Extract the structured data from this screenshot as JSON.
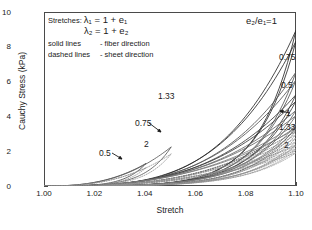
{
  "chart_data": {
    "type": "line",
    "title": "",
    "xlabel": "Stretch",
    "ylabel": "Cauchy Stress (kPa)",
    "xlim": [
      1.0,
      1.1
    ],
    "ylim": [
      0,
      10
    ],
    "xticks": [
      "1.00",
      "1.02",
      "1.04",
      "1.06",
      "1.08",
      "1.10"
    ],
    "yticks": [
      "0",
      "2",
      "4",
      "6",
      "8",
      "10"
    ],
    "grid": false,
    "legend_position": "inline-annotations",
    "notes": {
      "stretches_label": "Stretches:",
      "eq1": "λ₁ = 1 + e₁",
      "eq2": "λ₂ = 1 + e₂",
      "solid_key": "solid lines",
      "solid_desc": "- fiber direction",
      "dashed_key": "dashed lines",
      "dashed_desc": "- sheet direction"
    },
    "annotations": [
      {
        "name": "ratio-top",
        "text": "e₂/e₁=1",
        "x": 246,
        "y": 16
      },
      {
        "name": "ratio-075-right",
        "text": "0.75",
        "x": 279,
        "y": 53
      },
      {
        "name": "ratio-05-right",
        "text": "0.5",
        "x": 281,
        "y": 81
      },
      {
        "name": "ratio-1-right",
        "text": "1",
        "x": 286,
        "y": 109
      },
      {
        "name": "ratio-133-right",
        "text": "1.33",
        "x": 279,
        "y": 123
      },
      {
        "name": "ratio-2-right",
        "text": "2",
        "x": 284,
        "y": 141
      },
      {
        "name": "ratio-133-mid",
        "text": "1.33",
        "x": 158,
        "y": 92
      },
      {
        "name": "ratio-075-mid",
        "text": "0.75",
        "x": 135,
        "y": 119
      },
      {
        "name": "ratio-2-mid",
        "text": "2",
        "x": 144,
        "y": 140
      },
      {
        "name": "ratio-05-mid",
        "text": "0.5",
        "x": 99,
        "y": 149
      }
    ],
    "series": [
      {
        "name": "fiber e2/e1=1",
        "direction": "fiber",
        "ratio": "1",
        "style": "solid",
        "color": "#2b2b2b",
        "peak": 8.95,
        "loop": true
      },
      {
        "name": "fiber e2/e1=0.75",
        "direction": "fiber",
        "ratio": "0.75",
        "style": "solid",
        "color": "#555555",
        "peak": 6.55,
        "loop": true
      },
      {
        "name": "fiber e2/e1=0.5",
        "direction": "fiber",
        "ratio": "0.5",
        "style": "solid",
        "color": "#3a3a3a",
        "peak": 5.25,
        "loop": true
      },
      {
        "name": "fiber e2/e1=1.33",
        "direction": "fiber",
        "ratio": "1.33",
        "style": "solid",
        "color": "#666666",
        "peak": 4.35,
        "loop": true
      },
      {
        "name": "fiber e2/e1=2",
        "direction": "fiber",
        "ratio": "2",
        "style": "solid",
        "color": "#7a7a7a",
        "peak": 3.55,
        "loop": true
      },
      {
        "name": "sheet e2/e1=1",
        "direction": "sheet",
        "ratio": "1",
        "style": "dashed",
        "color": "#555555",
        "peak": 3.4,
        "loop": true
      },
      {
        "name": "sheet e2/e1=1.33",
        "direction": "sheet",
        "ratio": "1.33",
        "style": "dashed",
        "color": "#8a8a8a",
        "peak": 2.95,
        "loop": true
      },
      {
        "name": "sheet e2/e1=2",
        "direction": "sheet",
        "ratio": "2",
        "style": "dashed",
        "color": "#9a9a9a",
        "peak": 2.3,
        "loop": true
      },
      {
        "name": "sheet e2/e1=0.75",
        "direction": "sheet",
        "ratio": "0.75",
        "style": "dashed",
        "color": "#888888",
        "peak": 2.55,
        "loop": true
      },
      {
        "name": "sheet e2/e1=0.5",
        "direction": "sheet",
        "ratio": "0.5",
        "style": "dashed",
        "color": "#909090",
        "peak": 2.05,
        "loop": true
      }
    ],
    "short_curves": [
      {
        "name": "short-0.5-fiber",
        "end_x": 1.0405,
        "peak": 1.3,
        "style": "solid",
        "color": "#4a4a4a"
      },
      {
        "name": "short-2-fiber",
        "end_x": 1.0505,
        "peak": 2.25,
        "style": "solid",
        "color": "#5a5a5a"
      },
      {
        "name": "short-0.5-sheet",
        "end_x": 1.0405,
        "peak": 1.05,
        "style": "dashed",
        "color": "#8a8a8a"
      },
      {
        "name": "short-2-sheet",
        "end_x": 1.0505,
        "peak": 1.85,
        "style": "dashed",
        "color": "#8f8f8f"
      }
    ]
  }
}
